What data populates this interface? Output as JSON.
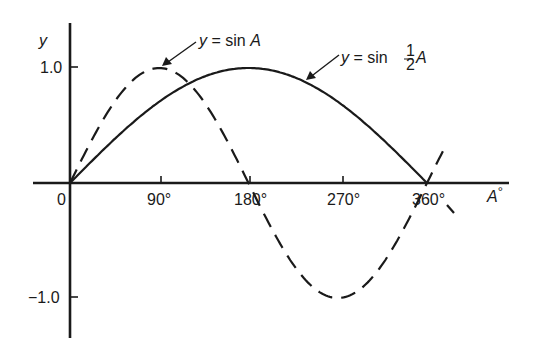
{
  "chart_data": {
    "type": "line",
    "title": "",
    "xlabel": "A°",
    "ylabel": "y",
    "xlim": [
      0,
      380
    ],
    "ylim": [
      -1.2,
      1.35
    ],
    "grid": false,
    "legend": "none (curves annotated with arrows)",
    "x_ticks": [
      {
        "value": 0,
        "label": "0"
      },
      {
        "value": 90,
        "label": "90°"
      },
      {
        "value": 180,
        "label": "180°"
      },
      {
        "value": 270,
        "label": "270°"
      },
      {
        "value": 360,
        "label": "360°"
      }
    ],
    "y_ticks": [
      {
        "value": 1.0,
        "label": "1.0"
      },
      {
        "value": -1.0,
        "label": "−1.0"
      }
    ],
    "x": [
      0,
      45,
      90,
      135,
      180,
      225,
      270,
      315,
      360
    ],
    "series": [
      {
        "name": "y = sin A",
        "style": "dashed",
        "values": [
          0,
          0.707,
          1.0,
          0.707,
          0,
          -0.707,
          -1.0,
          -0.707,
          0
        ]
      },
      {
        "name": "y = sin ½A",
        "style": "solid",
        "values": [
          0,
          0.383,
          0.707,
          0.924,
          1.0,
          0.924,
          0.707,
          0.383,
          0
        ]
      }
    ],
    "annotations": [
      {
        "text": "y = sin A",
        "points_to": {
          "x": 90,
          "y": 1.0
        }
      },
      {
        "text": "y = sin ½A",
        "points_to": {
          "x": 240,
          "y": 0.87
        }
      }
    ]
  },
  "labels": {
    "y_axis": "y",
    "x_axis_base": "A",
    "x_axis_sup": "°",
    "tick_0": "0",
    "tick_90": "90°",
    "tick_180": "180°",
    "tick_270": "270°",
    "tick_360": "360°",
    "y_pos": "1.0",
    "y_neg": "−1.0",
    "ann1_y": "y",
    "ann1_eq": " = sin ",
    "ann1_var": "A",
    "ann2_y": "y",
    "ann2_eq": " = sin ",
    "ann2_num": "1",
    "ann2_den": "2",
    "ann2_var": "A"
  }
}
